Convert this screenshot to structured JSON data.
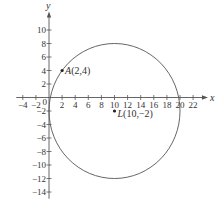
{
  "diagram": {
    "x_axis": {
      "label": "x",
      "ticks": [
        -4,
        -2,
        2,
        4,
        6,
        8,
        10,
        12,
        14,
        16,
        18,
        20,
        22
      ],
      "range": [
        -5,
        23.5
      ]
    },
    "y_axis": {
      "label": "y",
      "ticks": [
        10,
        8,
        6,
        4,
        2,
        -2,
        -4,
        -6,
        -8,
        -10,
        -12,
        -14
      ],
      "range": [
        -15,
        12
      ]
    },
    "origin_label": "0",
    "circle": {
      "center": [
        10,
        -2
      ],
      "radius": 10
    },
    "points": [
      {
        "name": "A",
        "x": 2,
        "y": 4,
        "label": "A(2,4)"
      },
      {
        "name": "L",
        "x": 10,
        "y": -2,
        "label": "L(10,−2)"
      }
    ],
    "colors": {
      "stroke": "#555555",
      "text": "#333333"
    }
  }
}
